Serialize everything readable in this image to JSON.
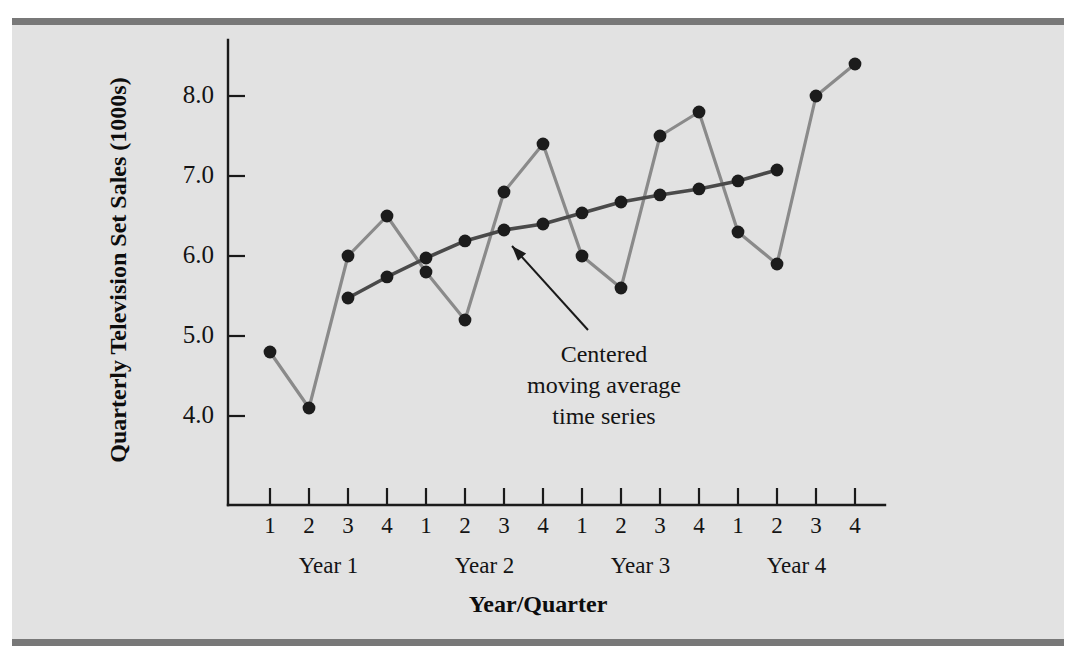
{
  "figure": {
    "background_color": "#e2e2e2",
    "rule_color": "#787878",
    "page_color": "#ffffff"
  },
  "chart_data": {
    "type": "line",
    "title": "",
    "xlabel": "Year/Quarter",
    "ylabel": "Quarterly Television Set Sales (1000s)",
    "grid": false,
    "legend_position": "none",
    "ylim": [
      3.4,
      8.7
    ],
    "yticks": [
      4.0,
      5.0,
      6.0,
      7.0,
      8.0
    ],
    "ytick_labels": [
      "4.0",
      "5.0",
      "6.0",
      "7.0",
      "8.0"
    ],
    "x": [
      1,
      2,
      3,
      4,
      5,
      6,
      7,
      8,
      9,
      10,
      11,
      12,
      13,
      14,
      15,
      16
    ],
    "categories": [
      "1",
      "2",
      "3",
      "4",
      "1",
      "2",
      "3",
      "4",
      "1",
      "2",
      "3",
      "4",
      "1",
      "2",
      "3",
      "4"
    ],
    "group_labels": [
      "Year 1",
      "Year 2",
      "Year 3",
      "Year 4"
    ],
    "group_spans": [
      [
        1,
        4
      ],
      [
        5,
        8
      ],
      [
        9,
        12
      ],
      [
        13,
        16
      ]
    ],
    "series": [
      {
        "name": "Quarterly television set sales",
        "color": "#8a8a8a",
        "marker_color": "#1c1c1c",
        "x": [
          1,
          2,
          3,
          4,
          5,
          6,
          7,
          8,
          9,
          10,
          11,
          12,
          13,
          14,
          15,
          16
        ],
        "values": [
          4.8,
          4.1,
          6.0,
          6.5,
          5.8,
          5.2,
          6.8,
          7.4,
          6.0,
          5.6,
          7.5,
          7.8,
          6.3,
          5.9,
          8.0,
          8.4
        ]
      },
      {
        "name": "Centered moving average time series",
        "color": "#4a4a4a",
        "marker_color": "#1c1c1c",
        "x": [
          3,
          4,
          5,
          6,
          7,
          8,
          9,
          10,
          11,
          12,
          13,
          14
        ],
        "values": [
          5.475,
          5.738,
          5.975,
          6.188,
          6.325,
          6.4,
          6.538,
          6.675,
          6.763,
          6.838,
          6.938,
          7.075
        ]
      }
    ],
    "annotations": [
      {
        "name": "centered-moving-average-annotation",
        "lines": [
          "Centered",
          "moving average",
          "time series"
        ],
        "text": "Centered moving average time series",
        "point_to": {
          "x": 7,
          "y": 6.325
        }
      }
    ]
  }
}
